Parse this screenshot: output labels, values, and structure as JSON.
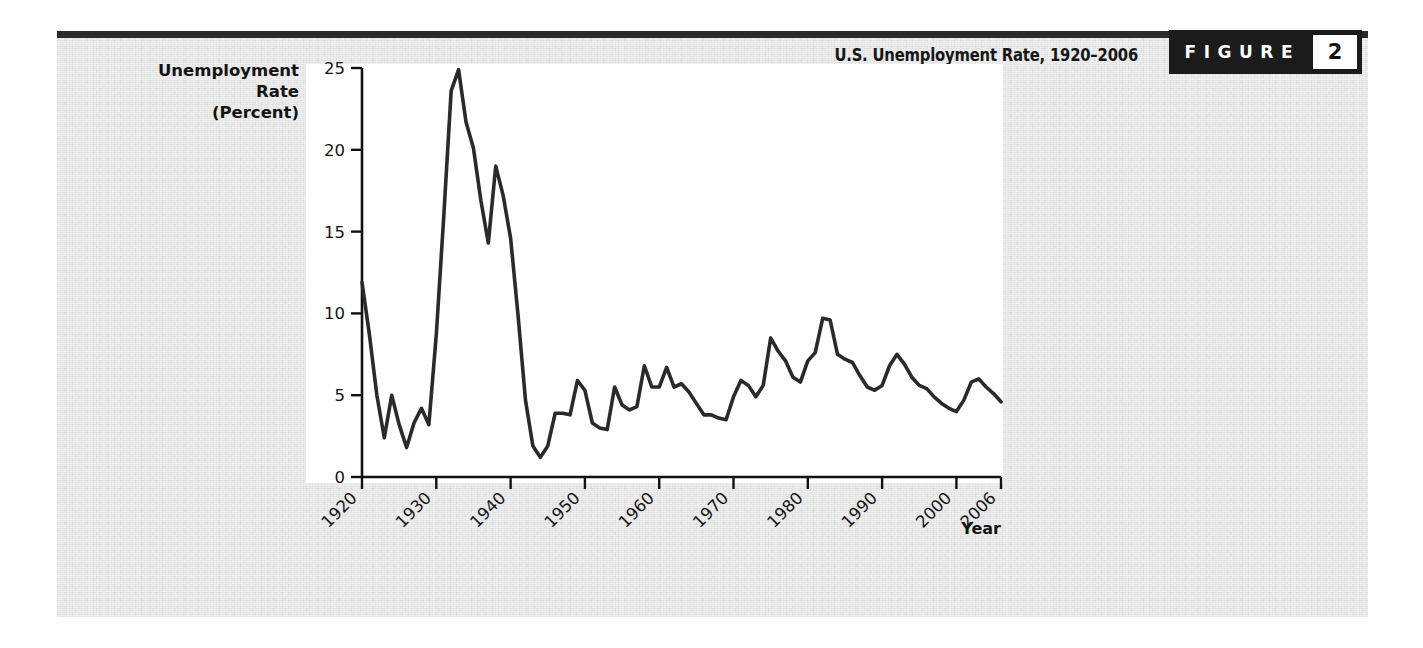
{
  "figure": {
    "title": "U.S. Unemployment Rate, 1920–2006",
    "badge_word": "FIGURE",
    "badge_number": "2"
  },
  "colors": {
    "page_background": "#eeeeee",
    "plot_background": "#ffffff",
    "rule": "#2b2b2b",
    "badge_background": "#1b1b1b",
    "badge_text": "#ffffff",
    "line": "#2a2a2a",
    "axis": "#111111",
    "text": "#151515"
  },
  "chart_data": {
    "type": "line",
    "title": "U.S. Unemployment Rate, 1920–2006",
    "xlabel": "Year",
    "ylabel": "Unemployment Rate (Percent)",
    "ylabel_lines": [
      "Unemployment",
      "Rate",
      "(Percent)"
    ],
    "xlim": [
      1920,
      2006
    ],
    "ylim": [
      0,
      25
    ],
    "yticks": [
      0,
      5,
      10,
      15,
      20,
      25
    ],
    "ytick_labels": [
      "0",
      "5",
      "10",
      "15",
      "20",
      "25"
    ],
    "xticks": [
      1920,
      1930,
      1940,
      1950,
      1960,
      1970,
      1980,
      1990,
      2000,
      2006
    ],
    "xtick_labels": [
      "1920",
      "1930",
      "1940",
      "1950",
      "1960",
      "1970",
      "1980",
      "1990",
      "2000",
      "2006"
    ],
    "xtick_rotation_deg": 45,
    "grid": false,
    "legend": false,
    "series": [
      {
        "name": "U.S. Unemployment Rate",
        "unit": "percent",
        "x": [
          1920,
          1921,
          1922,
          1923,
          1924,
          1925,
          1926,
          1927,
          1928,
          1929,
          1930,
          1931,
          1932,
          1933,
          1934,
          1935,
          1936,
          1937,
          1938,
          1939,
          1940,
          1941,
          1942,
          1943,
          1944,
          1945,
          1946,
          1947,
          1948,
          1949,
          1950,
          1951,
          1952,
          1953,
          1954,
          1955,
          1956,
          1957,
          1958,
          1959,
          1960,
          1961,
          1962,
          1963,
          1964,
          1965,
          1966,
          1967,
          1968,
          1969,
          1970,
          1971,
          1972,
          1973,
          1974,
          1975,
          1976,
          1977,
          1978,
          1979,
          1980,
          1981,
          1982,
          1983,
          1984,
          1985,
          1986,
          1987,
          1988,
          1989,
          1990,
          1991,
          1992,
          1993,
          1994,
          1995,
          1996,
          1997,
          1998,
          1999,
          2000,
          2001,
          2002,
          2003,
          2004,
          2005,
          2006
        ],
        "y": [
          11.9,
          8.7,
          5.0,
          2.4,
          5.0,
          3.2,
          1.8,
          3.3,
          4.2,
          3.2,
          8.7,
          15.9,
          23.6,
          24.9,
          21.7,
          20.1,
          16.9,
          14.3,
          19.0,
          17.2,
          14.6,
          9.9,
          4.7,
          1.9,
          1.2,
          1.9,
          3.9,
          3.9,
          3.8,
          5.9,
          5.3,
          3.3,
          3.0,
          2.9,
          5.5,
          4.4,
          4.1,
          4.3,
          6.8,
          5.5,
          5.5,
          6.7,
          5.5,
          5.7,
          5.2,
          4.5,
          3.8,
          3.8,
          3.6,
          3.5,
          4.9,
          5.9,
          5.6,
          4.9,
          5.6,
          8.5,
          7.7,
          7.1,
          6.1,
          5.8,
          7.1,
          7.6,
          9.7,
          9.6,
          7.5,
          7.2,
          7.0,
          6.2,
          5.5,
          5.3,
          5.6,
          6.8,
          7.5,
          6.9,
          6.1,
          5.6,
          5.4,
          4.9,
          4.5,
          4.2,
          4.0,
          4.7,
          5.8,
          6.0,
          5.5,
          5.1,
          4.6
        ]
      }
    ],
    "annotations": {
      "peak": {
        "year": 1933,
        "value": 24.9,
        "note": "Great Depression peak"
      },
      "trough": {
        "year": 1944,
        "value": 1.2,
        "note": "World War II low"
      }
    }
  }
}
